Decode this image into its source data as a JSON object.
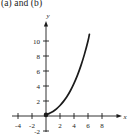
{
  "figure": {
    "caption": "(a) and (b)",
    "background_color": "#ffffff",
    "ink_color": "#1b1b1b"
  },
  "chart_data": {
    "type": "line",
    "title": "(a) and (b)",
    "xlabel": "x",
    "ylabel": "y",
    "grid": false,
    "legend": null,
    "xlim": [
      -5,
      9.5
    ],
    "ylim": [
      -3,
      12
    ],
    "xticks": [
      -4,
      -2,
      2,
      4,
      6,
      8
    ],
    "yticks": [
      -2,
      2,
      4,
      6,
      8,
      10
    ],
    "xtick_labels": [
      "-4",
      "-2",
      "2",
      "4",
      "6",
      "8"
    ],
    "ytick_labels": [
      "-2",
      "2",
      "4",
      "6",
      "8",
      "10"
    ],
    "axis_arrows": [
      "x-positive",
      "y-positive"
    ],
    "series": [
      {
        "name": "curve",
        "style": "solid",
        "color": "#1b1b1b",
        "x": [
          0,
          0.5,
          1,
          1.5,
          2,
          2.5,
          3,
          3.5,
          4,
          4.5,
          5,
          5.5,
          6,
          6.2
        ],
        "y": [
          0.15,
          0.35,
          0.6,
          0.95,
          1.4,
          1.95,
          2.6,
          3.4,
          4.35,
          5.45,
          6.75,
          8.25,
          10.0,
          10.9
        ]
      }
    ],
    "points": [
      {
        "name": "closed-endpoint",
        "x": 0,
        "y": 0.15,
        "marker": "filled-circle"
      }
    ]
  }
}
